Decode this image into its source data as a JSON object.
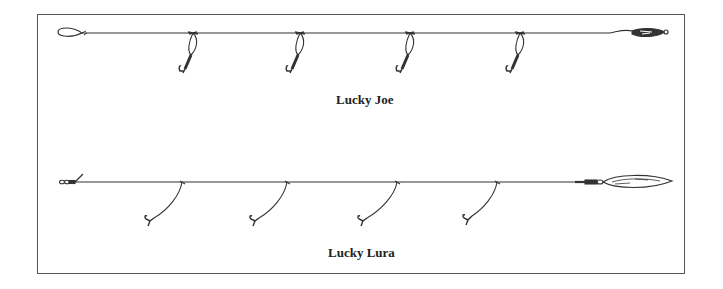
{
  "diagram": {
    "colors": {
      "line": "#333333",
      "frame": "#555555",
      "background": "#ffffff"
    },
    "rigs": [
      {
        "name": "Lucky Joe",
        "label": "Lucky Joe",
        "type": "sabiki-style rig with flies on short droppers and a sinker",
        "dropper_count": 4,
        "terminal": "sinker",
        "leading_end": "loop"
      },
      {
        "name": "Lucky Lura",
        "label": "Lucky Lura",
        "type": "rig with long curved droppers and a spoon lure",
        "dropper_count": 4,
        "terminal": "spoon-lure",
        "leading_end": "swivel"
      }
    ]
  }
}
